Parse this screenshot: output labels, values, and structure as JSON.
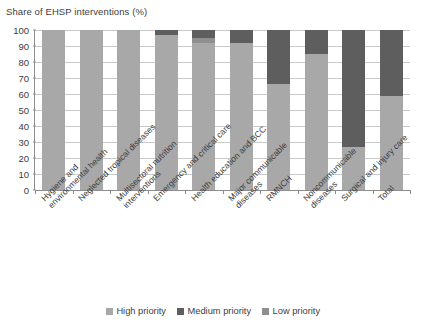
{
  "chart_data": {
    "type": "bar",
    "stacked": true,
    "title": "",
    "subtitle": "",
    "ylabel": "Share of EHSP interventions (%)",
    "xlabel": "",
    "ylim": [
      0,
      100
    ],
    "yticks": [
      100,
      90,
      80,
      70,
      60,
      50,
      40,
      30,
      20,
      10,
      0
    ],
    "grid": true,
    "legend_position": "bottom",
    "categories": [
      "Hygiene and environmental health",
      "Neglected tropical diseases",
      "Multisectoral nutrition interventions",
      "Emergency and critical care",
      "Health education and BCC",
      "Major communicable diseases",
      "RMNCH",
      "Noncommunicable diseases",
      "Surgical and injury care",
      "Total"
    ],
    "category_lines": [
      [
        "Hygiene and",
        "environmental health"
      ],
      [
        "Neglected tropical diseases"
      ],
      [
        "Multisectoral nutrition",
        "interventions"
      ],
      [
        "Emergency and critical care"
      ],
      [
        "Health education and BCC"
      ],
      [
        "Major communicable",
        "diseases"
      ],
      [
        "RMNCH"
      ],
      [
        "Noncommunicable",
        "diseases"
      ],
      [
        "Surgical and injury care"
      ],
      [
        "Total"
      ]
    ],
    "series": [
      {
        "name": "High priority",
        "color": "#a8a8a8",
        "values": [
          100,
          100,
          100,
          97,
          92,
          92,
          66,
          85,
          27,
          59
        ]
      },
      {
        "name": "Low priority",
        "color": "#8f8f8f",
        "values": [
          0,
          0,
          0,
          0,
          3,
          0,
          0,
          0,
          0,
          0
        ]
      },
      {
        "name": "Medium priority",
        "color": "#5e5e5e",
        "values": [
          0,
          0,
          0,
          3,
          5,
          8,
          34,
          15,
          73,
          41
        ]
      }
    ]
  },
  "legend": {
    "items": [
      {
        "label": "High priority",
        "color": "#a8a8a8"
      },
      {
        "label": "Medium priority",
        "color": "#5e5e5e"
      },
      {
        "label": "Low priority",
        "color": "#8f8f8f"
      }
    ]
  }
}
